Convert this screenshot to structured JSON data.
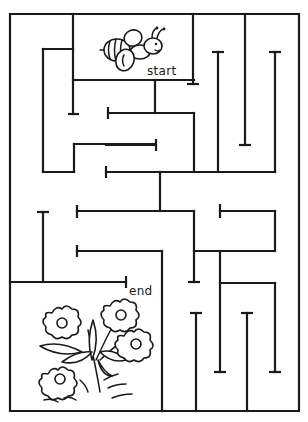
{
  "puzzle": {
    "type": "maze",
    "start_label": "start",
    "end_label": "end",
    "start_character": "bee-icon",
    "end_character": "flowers-icon",
    "ink_color": "#1a1a1a",
    "background_color": "#ffffff"
  }
}
